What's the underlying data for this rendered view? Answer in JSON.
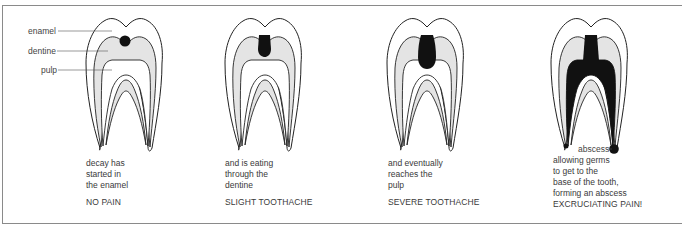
{
  "diagram": {
    "labels": {
      "enamel": "enamel",
      "dentine": "dentine",
      "pulp": "pulp",
      "abscess": "abscess"
    },
    "stages": [
      {
        "caption": "decay has\nstarted in\nthe enamel",
        "pain_level": "NO PAIN"
      },
      {
        "caption": "and is eating\nthrough the\ndentine",
        "pain_level": "SLIGHT TOOTHACHE"
      },
      {
        "caption": "and eventually\nreaches the\npulp",
        "pain_level": "SEVERE TOOTHACHE"
      },
      {
        "caption": "allowing germs\nto get to the\nbase of the tooth,\nforming an abscess",
        "pain_level": "EXCRUCIATING PAIN!"
      }
    ],
    "colors": {
      "enamel": "#ffffff",
      "dentine": "#e4e4e4",
      "pulp": "#ffffff",
      "decay": "#111111",
      "outline": "#222222",
      "frame": "#8a8a8a"
    }
  }
}
